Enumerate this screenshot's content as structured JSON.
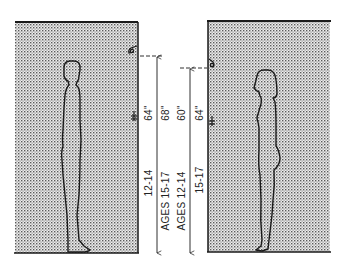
{
  "diagram": {
    "left_panel": {
      "subject": "male",
      "labels": {
        "height_short": "64\"",
        "height_tall": "68\"",
        "age_short": "12-14",
        "age_tall": "AGES 15-17"
      }
    },
    "right_panel": {
      "subject": "female",
      "labels": {
        "height_short": "60\"",
        "height_tall": "64\"",
        "age_short": "AGES 12-14",
        "age_tall": "15-17"
      }
    },
    "colors": {
      "ink": "#1a1a1a",
      "stipple": "#555555",
      "background": "#ffffff"
    }
  }
}
